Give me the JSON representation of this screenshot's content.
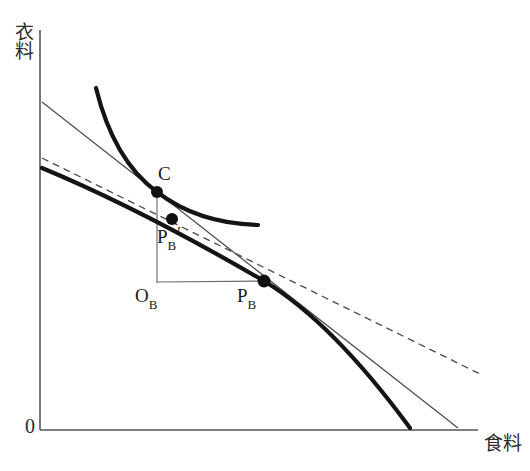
{
  "figure": {
    "type": "economics-diagram",
    "background_color": "#ffffff",
    "axes": {
      "y_label": "衣料",
      "x_label": "食料",
      "origin_label": "0",
      "axis_color": "#55555a",
      "origin_px": [
        40,
        430
      ],
      "y_top_px": [
        40,
        30
      ],
      "x_right_px": [
        478,
        430
      ]
    },
    "points": [
      {
        "name": "C",
        "label": "C",
        "subscript": "",
        "prime": false,
        "x": 157,
        "y": 192
      },
      {
        "name": "PB_prime",
        "label": "P",
        "subscript": "B",
        "prime": true,
        "x": 172,
        "y": 219
      },
      {
        "name": "PB",
        "label": "P",
        "subscript": "B",
        "prime": false,
        "x": 264,
        "y": 281
      },
      {
        "name": "OB",
        "label": "O",
        "subscript": "B",
        "prime": false,
        "x": 157,
        "y": 282
      }
    ],
    "labels": {
      "C": "C",
      "PB_prime_base": "P",
      "PB_prime_sub": "B",
      "PB_prime_mark": "′",
      "OB_base": "O",
      "OB_sub": "B",
      "PB_base": "P",
      "PB_sub": "B"
    },
    "curves": [
      {
        "name": "indifference-curve",
        "style": "thick-solid",
        "color": "#141414",
        "width_px": 4.2,
        "path": "M 96 88 C 108 132, 128 170, 157 192 C 186 214, 220 224, 258 225"
      },
      {
        "name": "production-possibility-frontier",
        "style": "thick-solid",
        "color": "#141414",
        "width_px": 4.2,
        "path": "M 42 168 C 110 196, 190 238, 264 281 C 320 315, 372 378, 410 428"
      },
      {
        "name": "world-price-line",
        "style": "thin-solid",
        "color": "#4d4d52",
        "width_px": 1.2,
        "path": "M 42 102 L 458 428"
      },
      {
        "name": "domestic-price-line",
        "style": "dashed",
        "color": "#4d4d52",
        "width_px": 1.3,
        "dash": "7,5",
        "path": "M 42 158 L 480 374"
      },
      {
        "name": "consumption-vertical-drop",
        "style": "thin-solid",
        "color": "#6a6a70",
        "width_px": 1.1,
        "path": "M 157 192 L 157 282"
      },
      {
        "name": "production-horizontal-base",
        "style": "thin-solid",
        "color": "#6a6a70",
        "width_px": 1.1,
        "path": "M 157 282 L 264 281"
      }
    ]
  }
}
